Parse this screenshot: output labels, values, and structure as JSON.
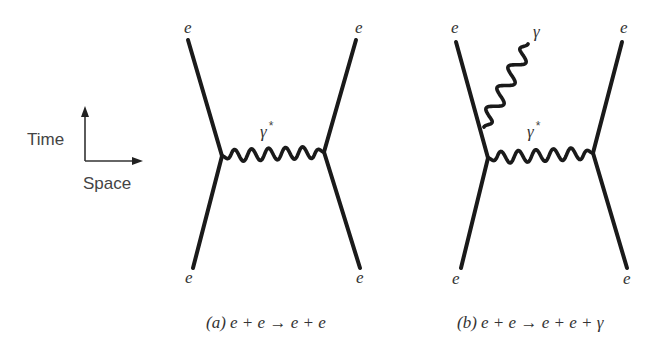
{
  "legend": {
    "time_label": "Time",
    "space_label": "Space",
    "axis": {
      "origin": [
        85,
        161
      ],
      "time_tip": [
        85,
        106
      ],
      "space_tip": [
        143,
        161
      ]
    }
  },
  "diagrams": [
    {
      "id": "a",
      "caption": {
        "tag": "(a)",
        "equation": "e + e → e + e",
        "x": 206,
        "y": 328
      },
      "fermion_lines": [
        {
          "from": [
            188,
            40
          ],
          "to": [
            222,
            156
          ],
          "label": "e",
          "label_pos": [
            184,
            33
          ]
        },
        {
          "from": [
            356,
            40
          ],
          "to": [
            324,
            152
          ],
          "label": "e",
          "label_pos": [
            355,
            33
          ]
        },
        {
          "from": [
            222,
            156
          ],
          "to": [
            193,
            268
          ],
          "label": "e",
          "label_pos": [
            185,
            283
          ]
        },
        {
          "from": [
            324,
            152
          ],
          "to": [
            360,
            268
          ],
          "label": "e",
          "label_pos": [
            356,
            283
          ]
        }
      ],
      "photons": [
        {
          "from": [
            222,
            156
          ],
          "to": [
            324,
            152
          ],
          "waves": 6,
          "amp": 6,
          "label": "γ",
          "label_sup": "*",
          "label_pos": [
            260,
            137
          ]
        }
      ]
    },
    {
      "id": "b",
      "caption": {
        "tag": "(b)",
        "equation": "e + e → e + e + γ",
        "x": 457,
        "y": 328
      },
      "fermion_lines": [
        {
          "from": [
            456,
            42
          ],
          "to": [
            488,
            158
          ],
          "label": "e",
          "label_pos": [
            451,
            33
          ]
        },
        {
          "from": [
            622,
            42
          ],
          "to": [
            593,
            153
          ],
          "label": "e",
          "label_pos": [
            620,
            33
          ]
        },
        {
          "from": [
            488,
            158
          ],
          "to": [
            461,
            268
          ],
          "label": "e",
          "label_pos": [
            452,
            284
          ]
        },
        {
          "from": [
            593,
            153
          ],
          "to": [
            627,
            268
          ],
          "label": "e",
          "label_pos": [
            623,
            284
          ]
        }
      ],
      "photons": [
        {
          "from": [
            488,
            158
          ],
          "to": [
            593,
            153
          ],
          "waves": 6,
          "amp": 6,
          "label": "γ",
          "label_sup": "*",
          "label_pos": [
            527,
            137
          ]
        },
        {
          "from": [
            484,
            127
          ],
          "to": [
            528,
            44
          ],
          "waves": 4,
          "amp": 7,
          "label": "γ",
          "label_sup": "",
          "label_pos": [
            533,
            37
          ]
        }
      ]
    }
  ]
}
